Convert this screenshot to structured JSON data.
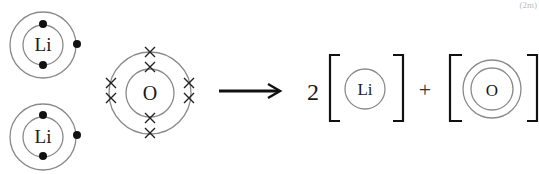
{
  "corner_mark": "(2m)",
  "reactants": {
    "lithium_1": {
      "symbol": "Li",
      "electrons": "2,1"
    },
    "lithium_2": {
      "symbol": "Li",
      "electrons": "2,1"
    },
    "oxygen": {
      "symbol": "O",
      "electrons": "2,6"
    }
  },
  "products": {
    "coefficient": "2",
    "lithium_ion": {
      "symbol": "Li"
    },
    "plus": "+",
    "oxide_ion": {
      "symbol": "O"
    }
  },
  "colors": {
    "shell": "#8a8a8a",
    "ink": "#1a1a1a"
  }
}
